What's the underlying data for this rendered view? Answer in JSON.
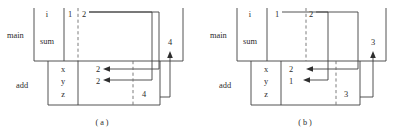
{
  "figure": {
    "panels": [
      {
        "id": "a",
        "caption": "( a )",
        "frames": [
          {
            "name": "main",
            "label": "main"
          },
          {
            "name": "add",
            "label": "add"
          }
        ],
        "main_variables": [
          {
            "name": "i",
            "label": "i",
            "value": "1",
            "pending": "2"
          },
          {
            "name": "sum",
            "label": "sum",
            "value": "",
            "pending": ""
          }
        ],
        "main_return": "4",
        "add_variables": [
          {
            "name": "x",
            "label": "x",
            "value": "2"
          },
          {
            "name": "y",
            "label": "y",
            "value": "2"
          },
          {
            "name": "z",
            "label": "z",
            "value": "4"
          }
        ]
      },
      {
        "id": "b",
        "caption": "( b )",
        "frames": [
          {
            "name": "main",
            "label": "main"
          },
          {
            "name": "add",
            "label": "add"
          }
        ],
        "main_variables": [
          {
            "name": "i",
            "label": "i",
            "value": "1",
            "pending": "2"
          },
          {
            "name": "sum",
            "label": "sum",
            "value": "",
            "pending": ""
          }
        ],
        "main_return": "3",
        "add_variables": [
          {
            "name": "x",
            "label": "x",
            "value": "2"
          },
          {
            "name": "y",
            "label": "y",
            "value": "1"
          },
          {
            "name": "z",
            "label": "z",
            "value": "3"
          }
        ]
      }
    ]
  },
  "colors": {
    "stroke": "#3f3f3f",
    "dashed": "#6d6d6d",
    "text": "#2b2b2b",
    "background": "#ffffff"
  }
}
